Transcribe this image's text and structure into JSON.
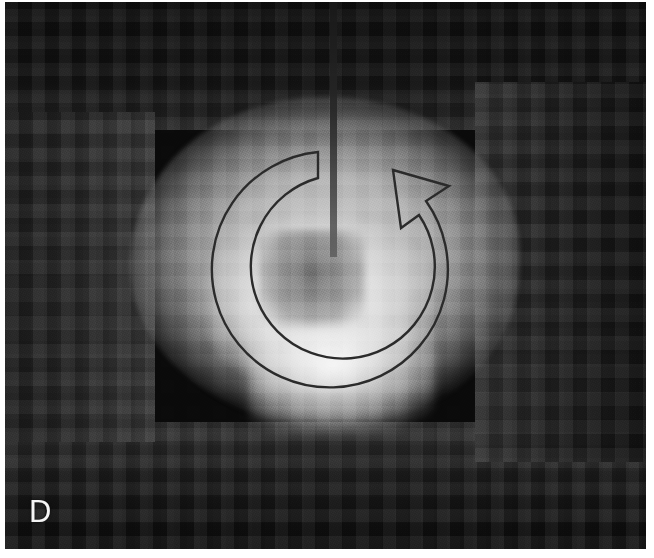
{
  "figure": {
    "panel_label": "D",
    "modality": "grayscale pixelated micrograph",
    "width_px": 654,
    "height_px": 558,
    "background_color": "#0a0a0a",
    "specimen_color": "#e8e8e8",
    "label_color": "#f4f4f4"
  },
  "image_area": {
    "name": "micrograph-image",
    "left_px": 5,
    "top_px": 2,
    "width_px": 641,
    "height_px": 547
  },
  "annotations": {
    "rotation_arrow": {
      "icon": "circular-rotation-arrow-icon",
      "style": "outlined",
      "direction": "clockwise",
      "stroke_color": "#2b2b2b",
      "stroke_width_px": 2,
      "center_x_px": 320,
      "center_y_px": 268,
      "outer_radius_px": 118,
      "inner_radius_px": 92,
      "arrowhead_position": "upper-right",
      "tail_position": "upper-left"
    },
    "probe_needle": {
      "icon": "vertical-needle-icon",
      "color": "#232323",
      "left_px": 325,
      "top_px": 0,
      "width_px": 7,
      "height_px": 255
    }
  }
}
